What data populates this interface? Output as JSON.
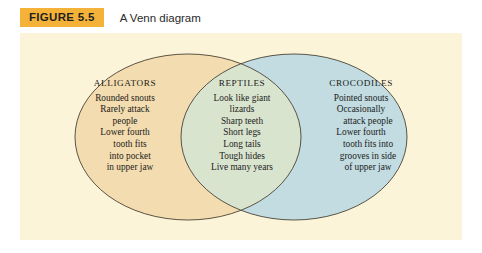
{
  "figure": {
    "tag": "FIGURE 5.5",
    "caption": "A Venn diagram"
  },
  "colors": {
    "page_background": "#ffffff",
    "panel_background": "#fcf4d8",
    "tag_background": "#f4b338",
    "left_circle_fill": "#f3dcaf",
    "right_circle_fill": "#c2dce1",
    "overlap_fill": "#d9e4cf",
    "outline": "#4a4336",
    "text": "#1b1b1b"
  },
  "diagram": {
    "type": "venn",
    "set_count": 2,
    "regions": [
      {
        "id": "alligators",
        "position": "left-only",
        "title": "ALLIGATORS",
        "lines": [
          "Rounded snouts",
          "Rarely attack",
          "people",
          "Lower fourth",
          "tooth fits",
          "into pocket",
          "in upper jaw"
        ]
      },
      {
        "id": "reptiles",
        "position": "intersection",
        "title": "REPTILES",
        "lines": [
          "Look like giant",
          "lizards",
          "Sharp teeth",
          "Short legs",
          "Long tails",
          "Tough hides",
          "Live many years"
        ]
      },
      {
        "id": "crocodiles",
        "position": "right-only",
        "title": "CROCODILES",
        "lines": [
          "Pointed snouts",
          "Occasionally",
          "attack people",
          "Lower fourth",
          "tooth fits into",
          "grooves in side",
          "of upper jaw"
        ]
      }
    ]
  }
}
